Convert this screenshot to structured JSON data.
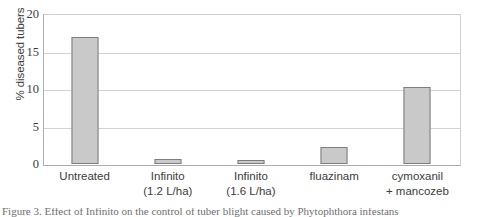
{
  "chart_data": {
    "type": "bar",
    "title": "",
    "xlabel": "",
    "ylabel": "% diseased tubers",
    "ylim": [
      0,
      20
    ],
    "yticks": [
      0,
      5,
      10,
      15,
      20
    ],
    "ytick_labels": [
      "0",
      "5",
      "10",
      "15",
      "20"
    ],
    "grid": "horizontal",
    "legend": "none",
    "categories": [
      "Untreated",
      "Infinito (1.2 L/ha)",
      "Infinito (1.6 L/ha)",
      "fluazinam",
      "cymoxanil + mancozeb"
    ],
    "category_lines": [
      [
        "Untreated",
        ""
      ],
      [
        "Infinito",
        "(1.2 L/ha)"
      ],
      [
        "Infinito",
        "(1.6 L/ha)"
      ],
      [
        "fluazinam",
        ""
      ],
      [
        "cymoxanil",
        "+ mancozeb"
      ]
    ],
    "values": [
      16.9,
      0.7,
      0.6,
      2.3,
      10.3
    ],
    "series": [
      {
        "name": "% diseased tubers",
        "values": [
          16.9,
          0.7,
          0.6,
          2.3,
          10.3
        ]
      }
    ],
    "bar_fill_color": "#C9C9C9",
    "bar_border_color": "#7D7D7D",
    "gridline_color": "#D2D2D2",
    "axis_color": "#AEAEAE"
  },
  "caption": {
    "partial_text": "Figure 3. Effect of Infinito on the control of tuber blight caused by Phytophthora infestans"
  }
}
